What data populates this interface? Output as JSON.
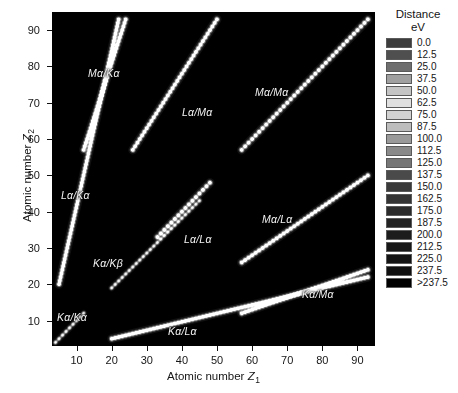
{
  "figure": {
    "title_visible": false,
    "background": "#ffffff",
    "plot_background": "#000000"
  },
  "axes": {
    "xlabel_text": "Atomic number",
    "xlabel_symbol": "Z",
    "xlabel_subscript": "1",
    "ylabel_text": "Atomic number",
    "ylabel_symbol": "Z",
    "ylabel_subscript": "2",
    "xticks": [
      10,
      20,
      30,
      40,
      50,
      60,
      70,
      80,
      90
    ],
    "yticks": [
      10,
      20,
      30,
      40,
      50,
      60,
      70,
      80,
      90
    ],
    "xlim": [
      3,
      95
    ],
    "ylim": [
      3,
      95
    ]
  },
  "legend": {
    "title": "Distance",
    "unit": "eV",
    "position": "right",
    "entries": [
      {
        "label": "0.0",
        "color": "#3d3d3d"
      },
      {
        "label": "12.5",
        "color": "#4f4f4f"
      },
      {
        "label": "25.0",
        "color": "#6e6e6e"
      },
      {
        "label": "37.5",
        "color": "#a0a0a0"
      },
      {
        "label": "50.0",
        "color": "#c4c4c4"
      },
      {
        "label": "62.5",
        "color": "#e0e0e0"
      },
      {
        "label": "75.0",
        "color": "#d2d2d2"
      },
      {
        "label": "87.5",
        "color": "#bdbdbd"
      },
      {
        "label": "100.0",
        "color": "#9a9a9a"
      },
      {
        "label": "112.5",
        "color": "#8a8a8a"
      },
      {
        "label": "125.0",
        "color": "#767676"
      },
      {
        "label": "137.5",
        "color": "#4a4a4a"
      },
      {
        "label": "150.0",
        "color": "#3a3a3a"
      },
      {
        "label": "162.5",
        "color": "#343434"
      },
      {
        "label": "175.0",
        "color": "#2b2b2b"
      },
      {
        "label": "187.5",
        "color": "#232323"
      },
      {
        "label": "200.0",
        "color": "#1c1c1c"
      },
      {
        "label": "212.5",
        "color": "#181818"
      },
      {
        "label": "225.0",
        "color": "#141414"
      },
      {
        "label": "237.5",
        "color": "#101010"
      },
      {
        "label": ">237.5",
        "color": "#000000"
      }
    ]
  },
  "annotations": [
    {
      "id": "ma-ka",
      "label": "Mα/Kα",
      "x": 88,
      "y": 67
    },
    {
      "id": "la-ma",
      "label": "Lα/Mα",
      "x": 182,
      "y": 106
    },
    {
      "id": "ma-ma",
      "label": "Mα/Mα",
      "x": 255,
      "y": 86
    },
    {
      "id": "la-ka",
      "label": "Lα/Kα",
      "x": 61,
      "y": 189
    },
    {
      "id": "ka-kb",
      "label": "Kα/Kβ",
      "x": 93,
      "y": 257
    },
    {
      "id": "la-la",
      "label": "Lα/Lα",
      "x": 184,
      "y": 233
    },
    {
      "id": "ma-la",
      "label": "Mα/Lα",
      "x": 262,
      "y": 213
    },
    {
      "id": "ka-ka",
      "label": "Kα/Kα",
      "x": 57,
      "y": 311
    },
    {
      "id": "ka-la",
      "label": "Kα/Lα",
      "x": 168,
      "y": 325
    },
    {
      "id": "ka-ma",
      "label": "Kα/Mα",
      "x": 302,
      "y": 288
    }
  ],
  "chart_data": {
    "type": "heatmap",
    "title": "",
    "xlabel": "Atomic number Z1",
    "ylabel": "Atomic number Z2",
    "xlim": [
      3,
      95
    ],
    "ylim": [
      3,
      95
    ],
    "grid": false,
    "colorbar": {
      "label": "Distance eV",
      "unit": "eV",
      "levels": [
        0.0,
        12.5,
        25.0,
        37.5,
        50.0,
        62.5,
        75.0,
        87.5,
        100.0,
        112.5,
        125.0,
        137.5,
        150.0,
        162.5,
        175.0,
        187.5,
        200.0,
        212.5,
        225.0,
        237.5,
        250.0
      ],
      "top_label": ">237.5",
      "scale": "discrete",
      "n_levels": 21
    },
    "bands": [
      {
        "name": "Mα/Kα",
        "line_pair": "Ma-Ka",
        "z1_start": 12,
        "z1_end": 24,
        "z2_start": 57,
        "z2_end": 93,
        "slope": 3.0,
        "intensity": "bright",
        "beaded": true
      },
      {
        "name": "Lα/Mα",
        "line_pair": "La-Ma",
        "z1_start": 26,
        "z1_end": 50,
        "z2_start": 57,
        "z2_end": 93,
        "slope": 1.5,
        "intensity": "bright",
        "beaded": true
      },
      {
        "name": "Mα/Mα",
        "line_pair": "Ma-Ma",
        "z1_start": 57,
        "z1_end": 93,
        "z2_start": 57,
        "z2_end": 93,
        "slope": 1.0,
        "intensity": "bright",
        "beaded": true
      },
      {
        "name": "Lα/Kα",
        "line_pair": "La-Ka",
        "z1_start": 5,
        "z1_end": 22,
        "z2_start": 20,
        "z2_end": 93,
        "slope": 4.3,
        "intensity": "bright",
        "beaded": true
      },
      {
        "name": "Kα/Kβ",
        "line_pair": "Ka-Kb",
        "z1_start": 20,
        "z1_end": 45,
        "z2_start": 19,
        "z2_end": 43,
        "slope": 0.96,
        "intensity": "medium",
        "beaded": true
      },
      {
        "name": "Lα/Lα",
        "line_pair": "La-La",
        "z1_start": 33,
        "z1_end": 48,
        "z2_start": 33,
        "z2_end": 48,
        "slope": 1.0,
        "intensity": "bright",
        "beaded": true
      },
      {
        "name": "Mα/Lα",
        "line_pair": "Ma-La",
        "z1_start": 57,
        "z1_end": 93,
        "z2_start": 26,
        "z2_end": 50,
        "slope": 0.65,
        "intensity": "bright",
        "beaded": true
      },
      {
        "name": "Kα/Kα",
        "line_pair": "Ka-Ka",
        "z1_start": 4,
        "z1_end": 12,
        "z2_start": 4,
        "z2_end": 12,
        "slope": 1.0,
        "intensity": "medium",
        "beaded": true
      },
      {
        "name": "Kα/Lα",
        "line_pair": "Ka-La",
        "z1_start": 20,
        "z1_end": 93,
        "z2_start": 5,
        "z2_end": 22,
        "slope": 0.235,
        "intensity": "bright",
        "beaded": true
      },
      {
        "name": "Kα/Mα",
        "line_pair": "Ka-Ma",
        "z1_start": 57,
        "z1_end": 93,
        "z2_start": 12,
        "z2_end": 24,
        "slope": 0.33,
        "intensity": "bright",
        "beaded": true
      }
    ]
  }
}
